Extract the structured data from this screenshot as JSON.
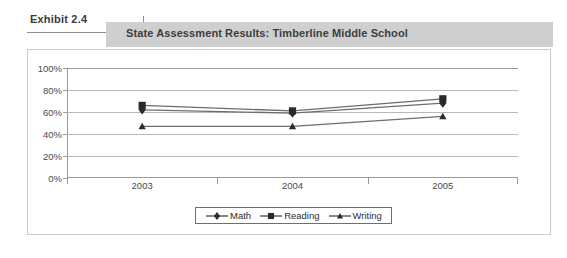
{
  "exhibit": {
    "label": "Exhibit 2.4"
  },
  "header": {
    "title": "State Assessment Results: Timberline Middle School",
    "band_color": "#cfcfcf"
  },
  "chart_data": {
    "type": "line",
    "title": "State Assessment Results: Timberline Middle School",
    "xlabel": "",
    "ylabel": "",
    "categories": [
      "2003",
      "2004",
      "2005"
    ],
    "ylim": [
      0,
      100
    ],
    "ytick_labels": [
      "100%",
      "80%",
      "60%",
      "40%",
      "20%",
      "0%"
    ],
    "ytick_values": [
      100,
      80,
      60,
      40,
      20,
      0
    ],
    "grid": true,
    "legend_position": "bottom-center",
    "series": [
      {
        "name": "Math",
        "marker": "diamond",
        "color": "#2a2a2a",
        "values": [
          62,
          59,
          68
        ]
      },
      {
        "name": "Reading",
        "marker": "square",
        "color": "#2a2a2a",
        "values": [
          66,
          61,
          72
        ]
      },
      {
        "name": "Writing",
        "marker": "triangle",
        "color": "#2a2a2a",
        "values": [
          47,
          47,
          56
        ]
      }
    ]
  }
}
